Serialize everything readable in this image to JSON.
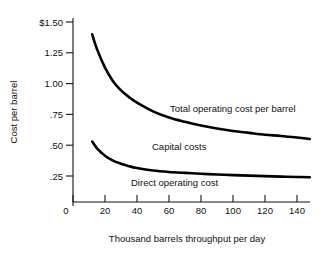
{
  "chart_data": {
    "type": "line",
    "title": "",
    "xlabel": "Thousand barrels throughput per day",
    "ylabel": "Cost per barrel",
    "xlim": [
      0,
      150
    ],
    "ylim": [
      0,
      1.5
    ],
    "grid": false,
    "legend": "inline-annotations",
    "x_ticks": [
      0,
      20,
      40,
      60,
      80,
      100,
      120,
      140
    ],
    "x_ticklabels": [
      "0",
      "20",
      "40",
      "60",
      "80",
      "100",
      "120",
      "140"
    ],
    "y_ticks": [
      0.25,
      0.5,
      0.75,
      1.0,
      1.25,
      1.5
    ],
    "y_ticklabels": [
      ".25",
      ".50",
      ".75",
      "1.00",
      "1.25",
      "$1.50"
    ],
    "series": [
      {
        "name": "Total operating cost per barrel",
        "x": [
          12,
          15,
          20,
          25,
          30,
          35,
          40,
          50,
          60,
          70,
          80,
          90,
          100,
          110,
          120,
          130,
          140,
          148
        ],
        "values": [
          1.4,
          1.28,
          1.13,
          1.02,
          0.945,
          0.89,
          0.845,
          0.775,
          0.725,
          0.69,
          0.66,
          0.635,
          0.615,
          0.6,
          0.585,
          0.575,
          0.562,
          0.55
        ]
      },
      {
        "name": "Direct operating cost",
        "x": [
          12,
          15,
          20,
          25,
          30,
          35,
          40,
          50,
          60,
          70,
          80,
          90,
          100,
          110,
          120,
          130,
          140,
          148
        ],
        "values": [
          0.53,
          0.475,
          0.415,
          0.375,
          0.35,
          0.33,
          0.315,
          0.295,
          0.283,
          0.275,
          0.268,
          0.262,
          0.257,
          0.253,
          0.249,
          0.245,
          0.242,
          0.24
        ]
      }
    ],
    "annotations": [
      {
        "text": "Total operating cost per barrel",
        "x_px": 170,
        "y_px": 112
      },
      {
        "text": "Capital costs",
        "x_px": 152,
        "y_px": 150
      },
      {
        "text": "Direct operating cost",
        "x_px": 131,
        "y_px": 186
      }
    ]
  }
}
